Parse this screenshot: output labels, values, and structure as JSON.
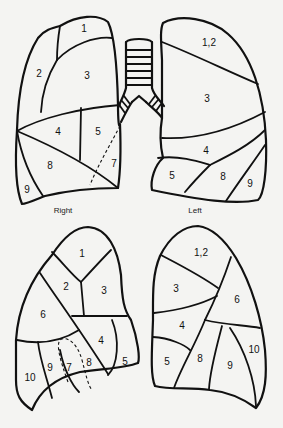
{
  "figure": {
    "type": "lung bronchopulmonary segments diagram",
    "captions": {
      "right": "Right",
      "left": "Left"
    },
    "anterior_view": {
      "right_lung": {
        "segments": [
          "1",
          "2",
          "3",
          "4",
          "5",
          "7",
          "8",
          "9"
        ]
      },
      "left_lung": {
        "segments": [
          "1,2",
          "3",
          "4",
          "5",
          "8",
          "9"
        ]
      }
    },
    "posterior_view": {
      "right_lung": {
        "segments": [
          "1",
          "2",
          "3",
          "6",
          "4",
          "5",
          "10",
          "9",
          "7",
          "8"
        ]
      },
      "left_lung": {
        "segments": [
          "1,2",
          "3",
          "6",
          "4",
          "5",
          "8",
          "9",
          "10"
        ]
      }
    }
  },
  "colors": {
    "background": "#f4f4f2",
    "stroke": "#111111"
  }
}
